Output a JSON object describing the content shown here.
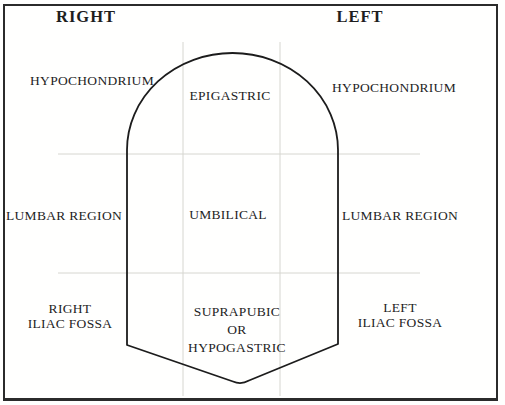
{
  "headers": {
    "right": "RIGHT",
    "left": "LEFT"
  },
  "regions": {
    "right_hypochondrium": "HYPOCHONDRIUM",
    "epigastric": "EPIGASTRIC",
    "left_hypochondrium": "HYPOCHONDRIUM",
    "right_lumbar": "LUMBAR REGION",
    "umbilical": "UMBILICAL",
    "left_lumbar": "LUMBAR REGION",
    "right_iliac_fossa": {
      "line1": "RIGHT",
      "line2": "ILIAC FOSSA"
    },
    "suprapubic": {
      "line1": "SUPRAPUBIC",
      "line2": "OR",
      "line3": "HYPOGASTRIC"
    },
    "left_iliac_fossa": {
      "line1": "LEFT",
      "line2": "ILIAC FOSSA"
    }
  },
  "colors": {
    "text": "#1e1e1e",
    "outline": "#1c1c1c",
    "border": "#2b2b2b",
    "grid": "#d6d6d0",
    "paper": "#fffffe"
  }
}
